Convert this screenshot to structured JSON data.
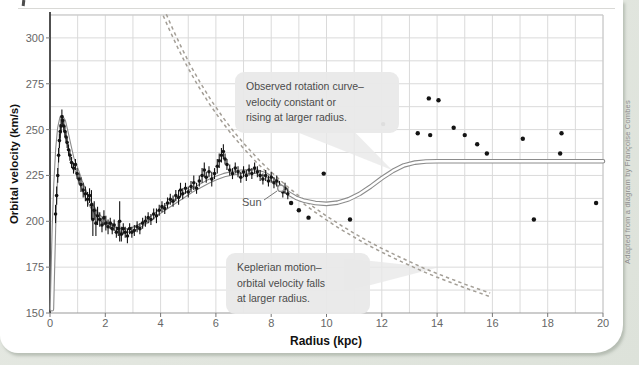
{
  "page": {
    "credit": "Adapted from a diagram by Françoise Combes"
  },
  "axes": {
    "y_title": "Orbital velocity (km/s)",
    "x_title": "Radius (kpc)"
  },
  "annotations": {
    "observed": {
      "lines": [
        "Observed rotation curve–",
        "velocity constant or",
        "rising at larger radius."
      ]
    },
    "keplerian": {
      "lines": [
        "Keplerian motion–",
        "orbital velocity falls",
        "at larger radius."
      ]
    },
    "sun_label": "Sun"
  },
  "colors": {
    "observed_curve": "#8c8c8c",
    "observed_core": "#ffffff",
    "keplerian_curve": "#a39e96",
    "grid": "#dadada",
    "border": "#c8c8c8",
    "axis_left": "#3d3d3d",
    "axis_bottom": "#9a9a9a",
    "tick_text": "#666666",
    "point": "#141414",
    "callout_bg": "#e9e9e9"
  },
  "chart_data": {
    "type": "scatter",
    "xlabel": "Radius (kpc)",
    "ylabel": "Orbital velocity (km/s)",
    "xlim": [
      0,
      20
    ],
    "ylim": [
      150,
      312.5
    ],
    "x_ticks": [
      0,
      2,
      4,
      6,
      8,
      10,
      12,
      14,
      16,
      18,
      20
    ],
    "y_ticks": [
      150,
      175,
      200,
      225,
      250,
      275,
      300
    ],
    "grid": {
      "x_step": 1,
      "y_step": 12.5
    },
    "sun": {
      "r": 8.35,
      "v": 218
    },
    "series": [
      {
        "name": "Observed rotation curve",
        "style": "double-solid",
        "points": [
          [
            0.07,
            152
          ],
          [
            0.1,
            172
          ],
          [
            0.14,
            196
          ],
          [
            0.2,
            220
          ],
          [
            0.27,
            240
          ],
          [
            0.34,
            251
          ],
          [
            0.42,
            256.5
          ],
          [
            0.5,
            254.5
          ],
          [
            0.6,
            248
          ],
          [
            0.7,
            241
          ],
          [
            0.8,
            234.5
          ],
          [
            0.95,
            228.5
          ],
          [
            1.1,
            222
          ],
          [
            1.3,
            214.5
          ],
          [
            1.5,
            208.5
          ],
          [
            1.7,
            204
          ],
          [
            1.9,
            200.5
          ],
          [
            2.1,
            198
          ],
          [
            2.3,
            196.2
          ],
          [
            2.5,
            195.2
          ],
          [
            2.7,
            194.8
          ],
          [
            2.9,
            195.2
          ],
          [
            3.1,
            196.4
          ],
          [
            3.3,
            198
          ],
          [
            3.6,
            201
          ],
          [
            3.9,
            204.5
          ],
          [
            4.2,
            207.5
          ],
          [
            4.5,
            210.5
          ],
          [
            4.8,
            213.5
          ],
          [
            5.1,
            216.5
          ],
          [
            5.4,
            219
          ],
          [
            5.7,
            221.5
          ],
          [
            6.0,
            223.5
          ],
          [
            6.3,
            225.2
          ],
          [
            6.6,
            226.2
          ],
          [
            6.9,
            227
          ],
          [
            7.2,
            227.3
          ],
          [
            7.5,
            227
          ],
          [
            7.8,
            225.5
          ],
          [
            8.0,
            223.5
          ],
          [
            8.2,
            221
          ],
          [
            8.4,
            218
          ],
          [
            8.6,
            215.5
          ],
          [
            8.9,
            212.8
          ],
          [
            9.2,
            211.2
          ],
          [
            9.6,
            210
          ],
          [
            10.0,
            209.5
          ],
          [
            10.4,
            210.2
          ],
          [
            10.8,
            212
          ],
          [
            11.2,
            215
          ],
          [
            11.6,
            219
          ],
          [
            12.0,
            223.5
          ],
          [
            12.4,
            227.5
          ],
          [
            12.8,
            230.5
          ],
          [
            13.2,
            232
          ],
          [
            13.6,
            232.6
          ],
          [
            14.0,
            232.7
          ],
          [
            15,
            232.7
          ],
          [
            16,
            232.7
          ],
          [
            17,
            232.7
          ],
          [
            18,
            232.7
          ],
          [
            19,
            232.7
          ],
          [
            20,
            232.7
          ]
        ]
      },
      {
        "name": "Keplerian motion",
        "style": "double-dashed",
        "points": [
          [
            4.15,
            312.5
          ],
          [
            4.4,
            304
          ],
          [
            4.7,
            294.3
          ],
          [
            5.0,
            285.3
          ],
          [
            5.4,
            274.6
          ],
          [
            5.8,
            264.9
          ],
          [
            6.2,
            256.2
          ],
          [
            6.6,
            248.3
          ],
          [
            7.0,
            241.2
          ],
          [
            7.5,
            233
          ],
          [
            8.0,
            225.6
          ],
          [
            8.5,
            218.8
          ],
          [
            9.0,
            212.7
          ],
          [
            9.5,
            207
          ],
          [
            10.0,
            201.8
          ],
          [
            10.5,
            196.9
          ],
          [
            11.0,
            192.4
          ],
          [
            11.5,
            188.1
          ],
          [
            12.0,
            184.2
          ],
          [
            12.5,
            180.5
          ],
          [
            13.0,
            177
          ],
          [
            13.5,
            173.6
          ],
          [
            14.0,
            170.5
          ],
          [
            14.5,
            167.6
          ],
          [
            15.0,
            164.7
          ],
          [
            15.5,
            162.1
          ],
          [
            15.9,
            160
          ]
        ]
      },
      {
        "name": "Measured velocities",
        "style": "scatter-errorbar",
        "points": [
          [
            0.2,
            204,
            5
          ],
          [
            0.24,
            214,
            5
          ],
          [
            0.28,
            225,
            4
          ],
          [
            0.31,
            236,
            4
          ],
          [
            0.34,
            244,
            4
          ],
          [
            0.37,
            249,
            4
          ],
          [
            0.4,
            252,
            4
          ],
          [
            0.43,
            257,
            4
          ],
          [
            0.46,
            255,
            3
          ],
          [
            0.5,
            252,
            3
          ],
          [
            0.54,
            249,
            3
          ],
          [
            0.58,
            246,
            3
          ],
          [
            0.62,
            243,
            3
          ],
          [
            0.67,
            239,
            3
          ],
          [
            0.72,
            236,
            3
          ],
          [
            0.78,
            232,
            3
          ],
          [
            0.85,
            229,
            3
          ],
          [
            0.92,
            231,
            3
          ],
          [
            0.98,
            226,
            3
          ],
          [
            1.05,
            223,
            3
          ],
          [
            1.12,
            220,
            4
          ],
          [
            1.2,
            217,
            4
          ],
          [
            1.28,
            215,
            4
          ],
          [
            1.36,
            212,
            4
          ],
          [
            1.43,
            214,
            4
          ],
          [
            1.5,
            209,
            8
          ],
          [
            1.55,
            201,
            9
          ],
          [
            1.6,
            206,
            5
          ],
          [
            1.66,
            199,
            7
          ],
          [
            1.72,
            203,
            5
          ],
          [
            1.8,
            201,
            4
          ],
          [
            1.88,
            198,
            4
          ],
          [
            1.95,
            202,
            4
          ],
          [
            2.02,
            199,
            4
          ],
          [
            2.1,
            197,
            4
          ],
          [
            2.18,
            199,
            3
          ],
          [
            2.25,
            196,
            3
          ],
          [
            2.32,
            198,
            3
          ],
          [
            2.4,
            194,
            3
          ],
          [
            2.47,
            196,
            4
          ],
          [
            2.52,
            200,
            11
          ],
          [
            2.58,
            193,
            4
          ],
          [
            2.65,
            196,
            3
          ],
          [
            2.72,
            194,
            3
          ],
          [
            2.8,
            192,
            4
          ],
          [
            2.88,
            196,
            3
          ],
          [
            2.96,
            194,
            3
          ],
          [
            3.05,
            195,
            3
          ],
          [
            3.15,
            197,
            3
          ],
          [
            3.25,
            196,
            3
          ],
          [
            3.35,
            199,
            3
          ],
          [
            3.45,
            200,
            3
          ],
          [
            3.55,
            202,
            3
          ],
          [
            3.65,
            201,
            3
          ],
          [
            3.75,
            204,
            3
          ],
          [
            3.85,
            203,
            4
          ],
          [
            3.95,
            206,
            3
          ],
          [
            4.05,
            208,
            3
          ],
          [
            4.15,
            207,
            3
          ],
          [
            4.25,
            210,
            3
          ],
          [
            4.35,
            212,
            3
          ],
          [
            4.45,
            211,
            3
          ],
          [
            4.55,
            214,
            3
          ],
          [
            4.65,
            213,
            4
          ],
          [
            4.72,
            217,
            4
          ],
          [
            4.8,
            215,
            3
          ],
          [
            4.9,
            218,
            3
          ],
          [
            5.0,
            216,
            3
          ],
          [
            5.1,
            219,
            3
          ],
          [
            5.2,
            221,
            4
          ],
          [
            5.3,
            218,
            3
          ],
          [
            5.4,
            222,
            3
          ],
          [
            5.5,
            225,
            4
          ],
          [
            5.58,
            228,
            4
          ],
          [
            5.65,
            224,
            3
          ],
          [
            5.75,
            227,
            3
          ],
          [
            5.85,
            223,
            4
          ],
          [
            5.95,
            226,
            3
          ],
          [
            6.05,
            230,
            4
          ],
          [
            6.12,
            233,
            4
          ],
          [
            6.2,
            236,
            4
          ],
          [
            6.27,
            238,
            4
          ],
          [
            6.33,
            234,
            3
          ],
          [
            6.4,
            231,
            3
          ],
          [
            6.5,
            228,
            3
          ],
          [
            6.6,
            226,
            3
          ],
          [
            6.7,
            229,
            3
          ],
          [
            6.8,
            227,
            3
          ],
          [
            6.9,
            224,
            3
          ],
          [
            7.0,
            227,
            3
          ],
          [
            7.1,
            225,
            3
          ],
          [
            7.2,
            228,
            3
          ],
          [
            7.3,
            226,
            3
          ],
          [
            7.4,
            229,
            3
          ],
          [
            7.5,
            227,
            3
          ],
          [
            7.6,
            225,
            3
          ],
          [
            7.7,
            223,
            3
          ],
          [
            7.8,
            225,
            3
          ],
          [
            7.9,
            222,
            3
          ],
          [
            8.0,
            224,
            3
          ],
          [
            8.1,
            221,
            3
          ],
          [
            8.2,
            222,
            3
          ],
          [
            8.3,
            219,
            3
          ],
          [
            8.42,
            216,
            3
          ],
          [
            8.5,
            218,
            3
          ],
          [
            8.6,
            215,
            3
          ],
          [
            8.72,
            210,
            0
          ],
          [
            9.0,
            206,
            0
          ],
          [
            9.35,
            202,
            0
          ],
          [
            9.9,
            226,
            0
          ],
          [
            10.85,
            201,
            0
          ],
          [
            12.05,
            253,
            0
          ],
          [
            13.3,
            248,
            0
          ],
          [
            13.7,
            267,
            0
          ],
          [
            14.05,
            266,
            0
          ],
          [
            13.75,
            247,
            0
          ],
          [
            14.6,
            251,
            0
          ],
          [
            15.0,
            247,
            0
          ],
          [
            15.45,
            242,
            0
          ],
          [
            15.8,
            237,
            0
          ],
          [
            17.1,
            245,
            0
          ],
          [
            18.45,
            237,
            0
          ],
          [
            18.5,
            248,
            0
          ],
          [
            17.5,
            201,
            0
          ],
          [
            19.75,
            210,
            0
          ]
        ]
      }
    ]
  }
}
